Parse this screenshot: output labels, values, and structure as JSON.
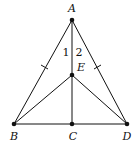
{
  "diagram": {
    "type": "geometry",
    "stroke_color": "#111111",
    "points": [
      {
        "id": "A",
        "label": "A",
        "x": 72,
        "y": 20,
        "lx": 72,
        "ly": 12
      },
      {
        "id": "E",
        "label": "E",
        "x": 72,
        "y": 75,
        "lx": 81,
        "ly": 70
      },
      {
        "id": "B",
        "label": "B",
        "x": 14,
        "y": 124,
        "lx": 14,
        "ly": 140
      },
      {
        "id": "C",
        "label": "C",
        "x": 72,
        "y": 124,
        "lx": 72,
        "ly": 140
      },
      {
        "id": "D",
        "label": "D",
        "x": 127,
        "y": 124,
        "lx": 127,
        "ly": 140
      }
    ],
    "segments": [
      [
        "A",
        "B"
      ],
      [
        "A",
        "D"
      ],
      [
        "A",
        "C"
      ],
      [
        "B",
        "D"
      ],
      [
        "B",
        "E"
      ],
      [
        "D",
        "E"
      ]
    ],
    "angle_labels": [
      {
        "label": "1",
        "x": 66,
        "y": 56
      },
      {
        "label": "2",
        "x": 79,
        "y": 56
      }
    ],
    "tick_marks": [
      {
        "segment": "AB",
        "x": 45,
        "y": 67
      },
      {
        "segment": "AD",
        "x": 97,
        "y": 67
      }
    ]
  }
}
